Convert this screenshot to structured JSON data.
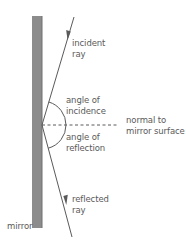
{
  "diagram": {
    "labels": {
      "incident_ray_line1": "incident",
      "incident_ray_line2": "ray",
      "angle_incidence_line1": "angle of",
      "angle_incidence_line2": "incidence",
      "angle_reflection_line1": "angle of",
      "angle_reflection_line2": "reflection",
      "normal_line1": "normal to",
      "normal_line2": "mirror surface",
      "reflected_ray_line1": "reflected",
      "reflected_ray_line2": "ray",
      "mirror": "mirror"
    },
    "colors": {
      "mirror_fill": "#8c8c8c",
      "mirror_edge": "#6e6e6e",
      "ray": "#5a5a5a",
      "text": "#5a5a5a",
      "background": "#ffffff"
    }
  }
}
